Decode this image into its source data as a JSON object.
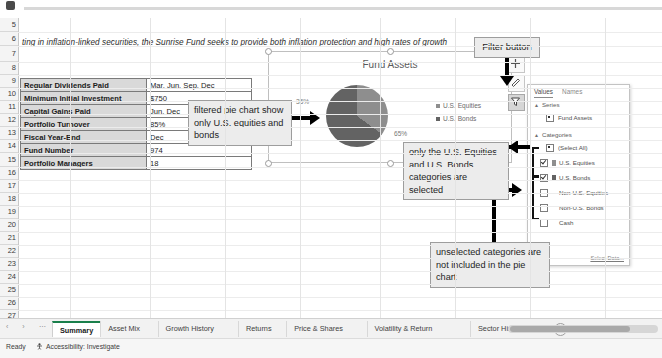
{
  "headline": "ting in inflation-linked securities, the Sunrise Fund seeks to provide both inflation protection and high rates of growth",
  "row_headers": [
    "5",
    "6",
    "7",
    "8",
    "9",
    "10",
    "11",
    "12",
    "13",
    "14",
    "15",
    "16",
    "17",
    "18",
    "19",
    "20",
    "21",
    "22",
    "23",
    "24",
    "25",
    "26",
    "27"
  ],
  "facts_table": {
    "rows": [
      {
        "key": "Regular Dividends Paid",
        "value": "Mar, Jun, Sep, Dec"
      },
      {
        "key": "Minimum Initial Investment",
        "value": "$750"
      },
      {
        "key": "Capital Gains Paid",
        "value": "Jun, Dec"
      },
      {
        "key": "Portfolio Turnover",
        "value": "85%"
      },
      {
        "key": "Fiscal Year-End",
        "value": "Dec"
      },
      {
        "key": "Fund Number",
        "value": "974"
      },
      {
        "key": "Portfolio Managers",
        "value": "18"
      }
    ]
  },
  "chart_data": {
    "type": "pie",
    "title": "Fund Assets",
    "categories": [
      "U.S. Equities",
      "U.S. Bonds"
    ],
    "values": [
      35,
      65
    ],
    "data_labels": [
      "35%",
      "65%"
    ],
    "colors": [
      "#8e8e8e",
      "#636363"
    ],
    "legend_position": "right",
    "grid": false
  },
  "filter_pane": {
    "tabs": [
      {
        "label": "Values",
        "selected": true
      },
      {
        "label": "Names",
        "selected": false
      }
    ],
    "groups": [
      {
        "label": "Series"
      },
      {
        "label": "Categories"
      }
    ],
    "series_items": [
      {
        "label": "Fund Assets"
      }
    ],
    "select_all_label": "(Select All)",
    "category_items": [
      {
        "label": "U.S. Equities",
        "checked": true
      },
      {
        "label": "U.S. Bonds",
        "checked": true
      },
      {
        "label": "Non-U.S. Equities",
        "checked": false
      },
      {
        "label": "Non-U.S. Bonds",
        "checked": false
      },
      {
        "label": "Cash",
        "checked": false
      }
    ],
    "select_data_link": "Select Data..."
  },
  "callouts": {
    "filter_button": "Filter button",
    "pie_filtered": "filtered pie chart show only U.S. equities and bonds",
    "selected_categories": "only the U.S. Equities and U.S. Bonds categories are selected",
    "unselected_categories": "unselected categories are not included in the pie chart"
  },
  "sheet_tabs": [
    {
      "label": "Summary",
      "active": true
    },
    {
      "label": "Asset Mix",
      "active": false
    },
    {
      "label": "Growth History",
      "active": false
    },
    {
      "label": "Returns",
      "active": false
    },
    {
      "label": "Price & Shares",
      "active": false
    },
    {
      "label": "Volatility & Return",
      "active": false
    },
    {
      "label": "Sector History",
      "active": false
    }
  ],
  "add_sheet_label": "+",
  "nav_buttons": "‹ › ⋯",
  "status_bar": {
    "ready": "Ready",
    "accessibility": "Accessibility: Investigate"
  },
  "colors": {
    "accent": "#1a7f4b",
    "slice_light": "#8e8e8e",
    "slice_dark": "#636363"
  }
}
